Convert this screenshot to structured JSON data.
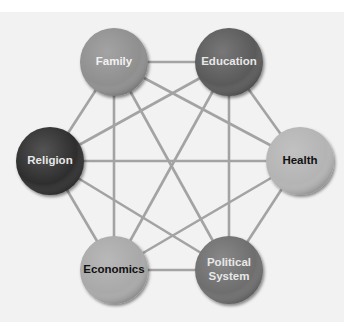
{
  "diagram": {
    "type": "complete-graph",
    "line_color": "#a3a3a3",
    "background": "#f2f2f2",
    "nodes": [
      {
        "id": "family",
        "label_lines": [
          "Family"
        ],
        "cx": 114,
        "cy": 62,
        "r": 34,
        "fill": "#8f8f8f",
        "text_color": "#f2f2f2"
      },
      {
        "id": "education",
        "label_lines": [
          "Education"
        ],
        "cx": 229,
        "cy": 62,
        "r": 34,
        "fill": "#5a5a5a",
        "text_color": "#e8e8e8"
      },
      {
        "id": "religion",
        "label_lines": [
          "Religion"
        ],
        "cx": 50,
        "cy": 161,
        "r": 34,
        "fill": "#2f2f2f",
        "text_color": "#e8e8e8"
      },
      {
        "id": "health",
        "label_lines": [
          "Health"
        ],
        "cx": 300,
        "cy": 161,
        "r": 34,
        "fill": "#b4b4b4",
        "text_color": "#111111"
      },
      {
        "id": "economics",
        "label_lines": [
          "Economics"
        ],
        "cx": 114,
        "cy": 270,
        "r": 34,
        "fill": "#a9a9a9",
        "text_color": "#111111"
      },
      {
        "id": "political-system",
        "label_lines": [
          "Political",
          "System"
        ],
        "cx": 229,
        "cy": 270,
        "r": 34,
        "fill": "#6e6e6e",
        "text_color": "#e8e8e8"
      }
    ],
    "edges": [
      [
        "family",
        "education"
      ],
      [
        "family",
        "religion"
      ],
      [
        "family",
        "health"
      ],
      [
        "family",
        "economics"
      ],
      [
        "family",
        "political-system"
      ],
      [
        "education",
        "religion"
      ],
      [
        "education",
        "health"
      ],
      [
        "education",
        "economics"
      ],
      [
        "education",
        "political-system"
      ],
      [
        "religion",
        "health"
      ],
      [
        "religion",
        "economics"
      ],
      [
        "religion",
        "political-system"
      ],
      [
        "health",
        "economics"
      ],
      [
        "health",
        "political-system"
      ],
      [
        "economics",
        "political-system"
      ]
    ]
  }
}
